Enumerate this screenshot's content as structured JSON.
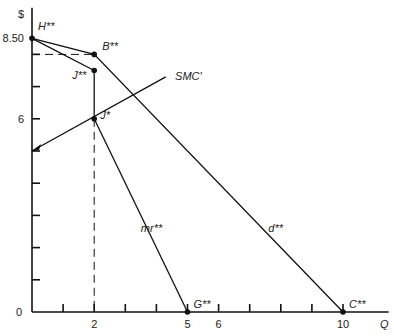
{
  "chart_data": {
    "type": "line",
    "title": "",
    "xlabel": "Q",
    "ylabel": "$",
    "xlim": [
      0,
      11.5
    ],
    "ylim": [
      0,
      9.2
    ],
    "x_ticks": [
      1,
      2,
      3,
      4,
      5,
      6,
      7,
      8,
      9,
      10
    ],
    "x_tick_labels": [
      {
        "value": 0,
        "label": "0"
      },
      {
        "value": 2,
        "label": "2"
      },
      {
        "value": 5,
        "label": "5"
      },
      {
        "value": 6,
        "label": "6"
      },
      {
        "value": 10,
        "label": "10"
      }
    ],
    "y_ticks": [
      1,
      2,
      3,
      4,
      5,
      6,
      7,
      8
    ],
    "y_tick_labels": [
      {
        "value": 6,
        "label": "6"
      },
      {
        "value": 8.5,
        "label": "8.50"
      }
    ],
    "points": [
      {
        "name": "H",
        "label": "H**",
        "x": 0,
        "y": 8.5
      },
      {
        "name": "B",
        "label": "B**",
        "x": 2,
        "y": 8
      },
      {
        "name": "J2",
        "label": "J**",
        "x": 2,
        "y": 7.5
      },
      {
        "name": "J1",
        "label": "J*",
        "x": 2,
        "y": 6
      },
      {
        "name": "G",
        "label": "G**",
        "x": 5,
        "y": 0
      },
      {
        "name": "C",
        "label": "C**",
        "x": 10,
        "y": 0
      }
    ],
    "series": [
      {
        "name": "d**",
        "label": "d**",
        "points": [
          [
            0,
            8.5
          ],
          [
            2,
            8
          ],
          [
            10,
            0
          ]
        ]
      },
      {
        "name": "mr-upper",
        "label": "",
        "points": [
          [
            0,
            8.5
          ],
          [
            2,
            7.5
          ]
        ]
      },
      {
        "name": "mr-gap",
        "label": "",
        "points": [
          [
            2,
            7.5
          ],
          [
            2,
            6
          ]
        ]
      },
      {
        "name": "mr**",
        "label": "mr**",
        "points": [
          [
            2,
            6
          ],
          [
            5,
            0
          ]
        ]
      },
      {
        "name": "SMC'",
        "label": "SMC'",
        "points": [
          [
            0,
            5
          ],
          [
            4.3,
            7.3
          ]
        ]
      }
    ],
    "dashed_guides": [
      {
        "from": [
          0,
          8
        ],
        "to": [
          2,
          8
        ]
      },
      {
        "from": [
          2,
          6
        ],
        "to": [
          2,
          0
        ]
      }
    ],
    "curve_labels": [
      {
        "text": "mr**",
        "x": 3.5,
        "y": 2.5
      },
      {
        "text": "d**",
        "x": 7.6,
        "y": 2.5
      },
      {
        "text": "SMC'",
        "x": 4.6,
        "y": 7.2
      }
    ],
    "grid": false,
    "legend": "none"
  }
}
